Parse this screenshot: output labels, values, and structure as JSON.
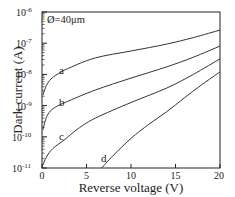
{
  "chart_data": {
    "type": "line",
    "title": "",
    "annotation": "Ø=40μm",
    "xlabel": "Reverse voltage (V)",
    "ylabel": "Dark current (A)",
    "xlim": [
      0,
      20
    ],
    "ylim": [
      1e-11,
      1e-06
    ],
    "yscale": "log",
    "xticks": [
      0,
      5,
      10,
      15,
      20
    ],
    "yticks": [
      "10-11",
      "10-10",
      "10-9",
      "10-8",
      "10-7",
      "10-6"
    ],
    "grid": false,
    "legend": "inline curve labels a, b, c, d",
    "series": [
      {
        "name": "a",
        "x": [
          0.1,
          0.5,
          1.0,
          1.7,
          3,
          6,
          10,
          14,
          17,
          20
        ],
        "log10_y": [
          -8.66,
          -8.35,
          -8.15,
          -8.0,
          -7.8,
          -7.47,
          -7.25,
          -7.03,
          -6.82,
          -6.58
        ]
      },
      {
        "name": "b",
        "x": [
          0.1,
          0.4,
          0.8,
          1.5,
          3,
          6,
          10,
          14,
          17,
          20
        ],
        "log10_y": [
          -9.78,
          -9.45,
          -9.22,
          -9.05,
          -8.85,
          -8.5,
          -8.12,
          -7.76,
          -7.45,
          -7.09
        ]
      },
      {
        "name": "c",
        "x": [
          0.0,
          0.5,
          1.2,
          2.5,
          4,
          6,
          10,
          14,
          17,
          20
        ],
        "log10_y": [
          -10.97,
          -10.65,
          -10.38,
          -10.1,
          -9.75,
          -9.4,
          -8.9,
          -8.44,
          -8.0,
          -7.5
        ]
      },
      {
        "name": "d",
        "x": [
          6.7,
          8,
          10,
          12,
          14,
          16,
          18,
          20
        ],
        "log10_y": [
          -11.0,
          -10.6,
          -10.05,
          -9.6,
          -9.2,
          -8.75,
          -8.32,
          -7.92
        ]
      }
    ]
  },
  "labels": {
    "annotation": "Ø=40μm",
    "xlabel": "Reverse voltage (V)",
    "ylabel": "Dark current (A)",
    "x_ticks": [
      "0",
      "5",
      "10",
      "15",
      "20"
    ],
    "y_tick_base": "10",
    "y_tick_exps": [
      "-6",
      "-7",
      "-8",
      "-9",
      "-10",
      "-11"
    ],
    "curves": [
      "a",
      "b",
      "c",
      "d"
    ]
  },
  "colors": {
    "line": "#333333",
    "axis": "#222222",
    "background": "#ffffff"
  }
}
